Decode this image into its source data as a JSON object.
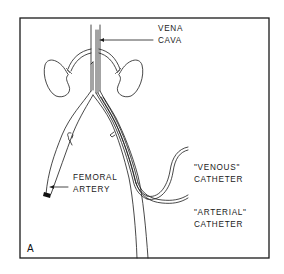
{
  "figure": {
    "panel_label": "A",
    "labels": {
      "vena_cava": [
        "VENA",
        "CAVA"
      ],
      "femoral_artery": [
        "FEMORAL",
        "ARTERY"
      ],
      "venous_catheter": [
        "\"VENOUS\"",
        "CATHETER"
      ],
      "arterial_catheter": [
        "\"ARTERIAL\"",
        "CATHETER"
      ]
    },
    "colors": {
      "line": "#1a1a1a",
      "background": "#ffffff"
    }
  }
}
